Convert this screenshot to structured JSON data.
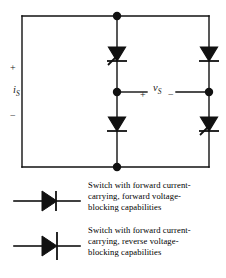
{
  "figure": {
    "kind": "circuit-schematic",
    "stroke_color": "#111111",
    "background_color": "#ffffff"
  },
  "circuit": {
    "source_label": {
      "symbol": "i",
      "subscript": "S",
      "plus": "+",
      "minus": "−"
    },
    "output_label": {
      "symbol": "v",
      "subscript": "S",
      "plus": "+",
      "minus": "−"
    },
    "switches": [
      {
        "position": "top-left",
        "type": "forward-voltage-blocking",
        "direction": "down"
      },
      {
        "position": "top-right",
        "type": "reverse-voltage-blocking",
        "direction": "down"
      },
      {
        "position": "bottom-left",
        "type": "reverse-voltage-blocking",
        "direction": "down"
      },
      {
        "position": "bottom-right",
        "type": "forward-voltage-blocking",
        "direction": "down"
      }
    ],
    "nodes": [
      {
        "name": "top-center",
        "x": 117,
        "y": 16
      },
      {
        "name": "bottom-center",
        "x": 117,
        "y": 167
      },
      {
        "name": "mid-left",
        "x": 117,
        "y": 92
      },
      {
        "name": "mid-right",
        "x": 209,
        "y": 92
      }
    ]
  },
  "legend": {
    "entries": [
      {
        "symbol_name": "switch-forward-voltage-blocking-symbol",
        "lines": [
          "Switch with forward current-",
          "carrying, forward voltage-",
          "blocking capabilities"
        ]
      },
      {
        "symbol_name": "switch-reverse-voltage-blocking-symbol",
        "lines": [
          "Switch with forward current-",
          "carrying, reverse voltage-",
          "blocking capabilities"
        ]
      }
    ]
  }
}
